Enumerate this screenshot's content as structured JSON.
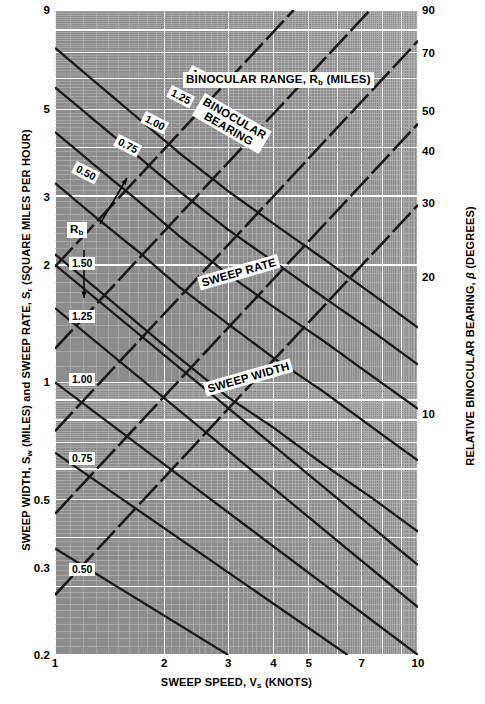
{
  "figure": {
    "x_axis_title_parts": {
      "pre": "SWEEP SPEED, V",
      "sub": "s",
      "post": " (KNOTS)"
    },
    "y_axis_left_title_parts": {
      "a": "SWEEP WIDTH, S",
      "a_sub": "w",
      "b": "  (MILES) and SWEEP RATE, S",
      "b_sub": "r",
      "c": "  (SQUARE MILES PER HOUR)"
    },
    "y_axis_right_title_parts": {
      "pre": "RELATIVE BINOCULAR BEARING, ",
      "beta": "β",
      "post": " (DEGREES)"
    },
    "header_label_parts": {
      "pre": "BINOCULAR RANGE, R",
      "sub": "b",
      "post": "  (MILES)"
    },
    "binocular_bearing_label_line1": "BINOCULAR",
    "binocular_bearing_label_line2": "BEARING",
    "sweep_rate_label": "SWEEP RATE",
    "sweep_width_label": "SWEEP WIDTH",
    "rb_callout_parts": {
      "pre": "R",
      "sub": "b"
    },
    "colors": {
      "plot_background": "#8d8d8d",
      "grid_major": "#ffffff",
      "grid_minor": "#bdbdbd",
      "curve": "#1a1a1a",
      "label_background": "#ffffff",
      "text": "#000000"
    }
  },
  "chart_data": {
    "type": "line",
    "xlabel": "SWEEP SPEED, Vs (KNOTS)",
    "ylabel": "SWEEP WIDTH, Sw (MILES) and SWEEP RATE, Sr (SQUARE MILES PER HOUR)",
    "ylabel_right": "RELATIVE BINOCULAR BEARING, β (DEGREES)",
    "scale": "log-log",
    "grid": true,
    "legend": "none",
    "xlim": [
      1,
      10
    ],
    "ylim": [
      0.2,
      9
    ],
    "ylim_right": [
      2,
      90
    ],
    "xticks": [
      1,
      2,
      3,
      4,
      5,
      7,
      10
    ],
    "xticklabels": [
      "1",
      "2",
      "3",
      "4",
      "5",
      "7",
      "10"
    ],
    "yticks_left": [
      0.2,
      0.3,
      0.5,
      1,
      2,
      3,
      5,
      9
    ],
    "yticklabels_left": [
      "0.2",
      "0.3",
      "0.5",
      "1",
      "2",
      "3",
      "5",
      "9"
    ],
    "yticks_right": [
      10,
      20,
      30,
      40,
      50,
      70,
      90
    ],
    "yticklabels_right": [
      "10",
      "20",
      "30",
      "40",
      "50",
      "70",
      "90"
    ],
    "series": [
      {
        "name": "Binocular range Rb = 1.50 (sweep rate curve)",
        "group": "sweep-rate",
        "style": "solid-curve",
        "label": "1.50",
        "x": [
          1.0,
          1.3,
          1.7,
          2.2,
          3.0,
          4.0,
          5.5,
          7.5,
          10.0
        ],
        "y": [
          24.0,
          19.5,
          15.8,
          12.9,
          10.3,
          8.5,
          6.9,
          5.6,
          4.6
        ]
      },
      {
        "name": "Binocular range Rb = 1.25 (sweep rate curve)",
        "group": "sweep-rate",
        "style": "solid-curve",
        "label": "1.25",
        "x": [
          1.0,
          1.3,
          1.7,
          2.2,
          3.0,
          4.0,
          5.5,
          7.5,
          10.0
        ],
        "y": [
          19.0,
          15.5,
          12.6,
          10.3,
          8.2,
          6.8,
          5.5,
          4.5,
          3.7
        ]
      },
      {
        "name": "Binocular range Rb = 1.00 (sweep rate curve)",
        "group": "sweep-rate",
        "style": "solid-curve",
        "label": "1.00",
        "x": [
          1.0,
          1.3,
          1.7,
          2.2,
          3.0,
          4.0,
          5.5,
          7.5,
          10.0
        ],
        "y": [
          14.6,
          11.9,
          9.7,
          7.9,
          6.3,
          5.2,
          4.25,
          3.45,
          2.85
        ]
      },
      {
        "name": "Binocular range Rb = 0.75 (sweep rate curve)",
        "group": "sweep-rate",
        "style": "solid-curve",
        "label": "0.75",
        "x": [
          1.0,
          1.3,
          1.7,
          2.2,
          3.0,
          4.0,
          5.5,
          7.5,
          10.0
        ],
        "y": [
          10.8,
          8.8,
          7.2,
          5.85,
          4.7,
          3.85,
          3.15,
          2.55,
          2.1
        ]
      },
      {
        "name": "Binocular range Rb = 0.50 (sweep rate curve)",
        "group": "sweep-rate",
        "style": "solid-curve",
        "label": "0.50",
        "x": [
          1.0,
          1.3,
          1.7,
          2.2,
          3.0,
          4.0,
          5.5,
          7.5,
          10.0
        ],
        "y": [
          7.1,
          5.8,
          4.7,
          3.85,
          3.05,
          2.55,
          2.05,
          1.68,
          1.38
        ]
      },
      {
        "name": "Sweep width Sw = 1.50",
        "group": "sweep-width",
        "style": "solid-line",
        "label": "1.50",
        "x": [
          1,
          10
        ],
        "y": [
          2.0,
          0.34
        ]
      },
      {
        "name": "Sweep width Sw = 1.25",
        "group": "sweep-width",
        "style": "solid-line",
        "label": "1.25",
        "x": [
          1,
          10
        ],
        "y": [
          1.55,
          0.265
        ]
      },
      {
        "name": "Sweep width Sw = 1.00",
        "group": "sweep-width",
        "style": "solid-line",
        "label": "1.00",
        "x": [
          1,
          10
        ],
        "y": [
          1.0,
          0.2
        ]
      },
      {
        "name": "Sweep width Sw = 0.75",
        "group": "sweep-width",
        "style": "solid-line",
        "label": "0.75",
        "x": [
          1,
          6.4
        ],
        "y": [
          0.66,
          0.2
        ]
      },
      {
        "name": "Sweep width Sw = 0.50",
        "group": "sweep-width",
        "style": "solid-line",
        "label": "0.50",
        "x": [
          1,
          3.0
        ],
        "y": [
          0.375,
          0.2
        ]
      },
      {
        "name": "Relative binocular bearing β (dashed rising lines)",
        "group": "bearing",
        "style": "dashed-line",
        "count": 5,
        "note": "Five parallel dashed lines rising left-to-right, read against the right-hand β (degrees) scale."
      }
    ],
    "annotations": [
      {
        "text": "BINOCULAR RANGE, Rb  (MILES)",
        "type": "header-box",
        "x": 2.0,
        "y": 6.6
      },
      {
        "text": "BINOCULAR BEARING",
        "type": "rotated-box",
        "x": 2.4,
        "y": 5.2
      },
      {
        "text": "SWEEP RATE",
        "type": "rotated-box",
        "x": 3.0,
        "y": 1.75
      },
      {
        "text": "SWEEP WIDTH",
        "type": "rotated-box",
        "x": 3.0,
        "y": 1.02
      },
      {
        "text": "Rb",
        "type": "callout-box",
        "x": 1.18,
        "y": 2.62,
        "arrows": [
          "up-right to 0.50 curve",
          "down to dashed bearing line"
        ]
      }
    ]
  },
  "ticks": {
    "left": [
      {
        "v": "9",
        "t": 0.0
      },
      {
        "v": "5",
        "t": 0.1542
      },
      {
        "v": "3",
        "t": 0.2894
      },
      {
        "v": "2",
        "t": 0.3951
      },
      {
        "v": "1",
        "t": 0.5773
      },
      {
        "v": "0.5",
        "t": 0.7595
      },
      {
        "v": "0.3",
        "t": 0.8652
      },
      {
        "v": "0.2",
        "t": 1.0
      }
    ],
    "right": [
      {
        "v": "90",
        "t": 0.0
      },
      {
        "v": "70",
        "t": 0.0663
      },
      {
        "v": "50",
        "t": 0.1561
      },
      {
        "v": "40",
        "t": 0.2187
      },
      {
        "v": "30",
        "t": 0.2999
      },
      {
        "v": "20",
        "t": 0.4136
      },
      {
        "v": "10",
        "t": 0.6258
      }
    ],
    "bottom": [
      {
        "v": "1",
        "t": 0.0
      },
      {
        "v": "2",
        "t": 0.301
      },
      {
        "v": "3",
        "t": 0.4771
      },
      {
        "v": "4",
        "t": 0.6021
      },
      {
        "v": "5",
        "t": 0.699
      },
      {
        "v": "7",
        "t": 0.8451
      },
      {
        "v": "10",
        "t": 1.0
      }
    ]
  }
}
